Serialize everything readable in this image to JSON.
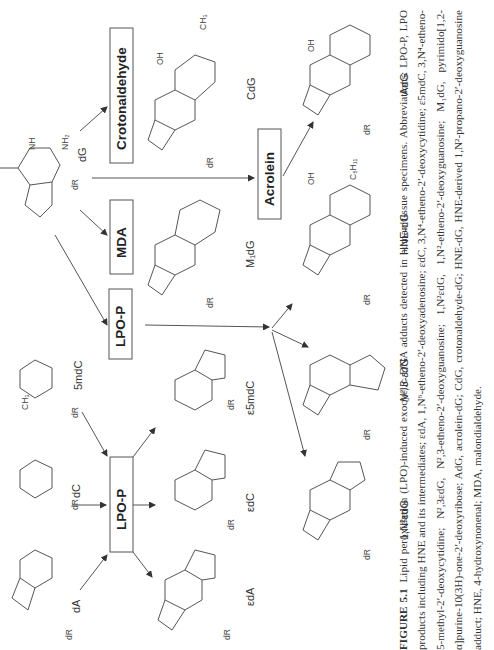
{
  "figure": {
    "orientation": "rotated-90-ccw",
    "reagent_boxes": [
      {
        "id": "crotonaldehyde",
        "label": "Crotonaldehyde"
      },
      {
        "id": "mda",
        "label": "MDA"
      },
      {
        "id": "lpo-p-upper",
        "label": "LPO-P"
      },
      {
        "id": "acrolein",
        "label": "Acrolein"
      },
      {
        "id": "lpo-p-lower",
        "label": "LPO-P"
      }
    ],
    "substrates": [
      {
        "id": "dG",
        "label": "dG"
      },
      {
        "id": "5mdC",
        "label": "5mdC"
      },
      {
        "id": "dC",
        "label": "dC"
      },
      {
        "id": "dA",
        "label": "dA"
      }
    ],
    "products": [
      {
        "id": "CdG",
        "label": "CdG"
      },
      {
        "id": "M1dG",
        "label": "M₁dG"
      },
      {
        "id": "e5mdC",
        "label": "ε5mdC"
      },
      {
        "id": "edC",
        "label": "εdC"
      },
      {
        "id": "edA",
        "label": "εdA"
      },
      {
        "id": "AdG",
        "label": "AdG"
      },
      {
        "id": "HNE-dG",
        "label": "HNE-dG"
      },
      {
        "id": "N2-3-edG",
        "label": "N²,3-εdG"
      },
      {
        "id": "1-N2-edG",
        "label": "1,N²εdG"
      }
    ],
    "atom_labels": {
      "N": "N",
      "NH": "NH",
      "NH2": "NH₂",
      "O": "O",
      "OH": "OH",
      "dR": "dR",
      "CH3": "CH₃",
      "C5H11": "C₅H₁₁",
      "H": "H"
    }
  },
  "caption": {
    "label": "FIGURE 5.1",
    "text": "Lipid peroxidation (LPO)-induced exocyclic DNA adducts detected in human tissue specimens. Abbreviations: LPO-P, LPO products including HNE and its intermediates; εdA, 1,N⁶-etheno-2′-deoxyadenosine; εdC, 3,N⁴-etheno-2′-deoxycytidine; ε5mdC, 3,N⁴-etheno-5-methyl-2′-deoxycytidine; N²,3εdG, N²,3-etheno-2′-deoxyguanosine; 1,N²εdG, 1,N²-etheno-2′-deoxyguanosine; M₁dG, pyrimido[1,2-α]purine-10(3H)-one-2′-deoxyribose; AdG, acrolein-dG; CdG, crotonaldehyde-dG; HNE-dG, HNE-derived 1,N²-propano-2′-deoxyguanosine adduct; HNE, 4-hydroxynonenal; MDA, malondialdehyde."
  }
}
